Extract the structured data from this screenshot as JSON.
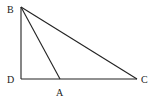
{
  "diagram": {
    "type": "triangle",
    "stroke_color": "#222222",
    "background": "#ffffff",
    "points": {
      "B": {
        "label": "B",
        "x": 21,
        "y": 7,
        "label_x": 7,
        "label_y": 13
      },
      "D": {
        "label": "D",
        "x": 21,
        "y": 79,
        "label_x": 7,
        "label_y": 83
      },
      "A": {
        "label": "A",
        "x": 60,
        "y": 79,
        "label_x": 56,
        "label_y": 96
      },
      "C": {
        "label": "C",
        "x": 137,
        "y": 79,
        "label_x": 141,
        "label_y": 83
      }
    },
    "segments": [
      {
        "from": "B",
        "to": "D"
      },
      {
        "from": "D",
        "to": "C"
      },
      {
        "from": "B",
        "to": "C"
      },
      {
        "from": "B",
        "to": "A"
      }
    ]
  }
}
